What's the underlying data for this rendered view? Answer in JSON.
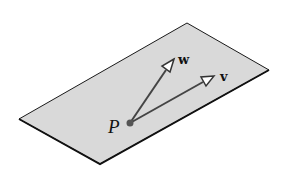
{
  "diagram": {
    "type": "plane-with-vectors",
    "plane": {
      "fill": "#d9d9d9",
      "stroke": "#1a1a1a",
      "corners": [
        [
          19,
          119
        ],
        [
          187,
          23
        ],
        [
          269,
          70
        ],
        [
          100,
          164
        ]
      ]
    },
    "point": {
      "label": "P",
      "x": 130,
      "y": 123,
      "color": "#555555"
    },
    "vectors": [
      {
        "label": "w",
        "from": [
          130,
          123
        ],
        "to": [
          173,
          60
        ],
        "color": "#444444"
      },
      {
        "label": "v",
        "from": [
          130,
          123
        ],
        "to": [
          213,
          77
        ],
        "color": "#444444"
      }
    ]
  }
}
